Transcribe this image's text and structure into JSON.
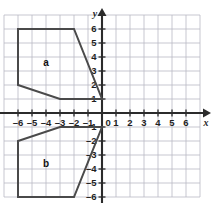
{
  "figure": {
    "background_color": "#ffffff",
    "grid_color": "#b9b9c4",
    "axis_color": "#2b2b2b",
    "shape_stroke_color": "#4a4a4a"
  },
  "axes": {
    "x_axis_name": "x",
    "y_axis_name": "y",
    "x_min": -7,
    "x_max": 7,
    "y_min": -6,
    "y_max": 7,
    "x_tick_labels": [
      "–6",
      "–5",
      "–4",
      "–3",
      "–2",
      "–1",
      "1",
      "2",
      "3",
      "4",
      "5",
      "6"
    ],
    "x_tick_values": [
      -6,
      -5,
      -4,
      -3,
      -2,
      -1,
      1,
      2,
      3,
      4,
      5,
      6
    ],
    "y_tick_labels": [
      "6",
      "5",
      "4",
      "3",
      "2",
      "1",
      "–1",
      "–2",
      "–3",
      "–4",
      "–5",
      "–6"
    ],
    "y_tick_values": [
      6,
      5,
      4,
      3,
      2,
      1,
      -1,
      -2,
      -3,
      -4,
      -5,
      -6
    ],
    "origin_label": "0"
  },
  "shapes": [
    {
      "name": "a",
      "label": "a",
      "label_x": -4,
      "label_y": 3.6,
      "vertices": [
        [
          -6,
          6
        ],
        [
          -2,
          6
        ],
        [
          0,
          1
        ],
        [
          -3,
          1
        ],
        [
          -6,
          2
        ]
      ]
    },
    {
      "name": "b",
      "label": "b",
      "label_x": -4,
      "label_y": -3.6,
      "vertices": [
        [
          -6,
          -6
        ],
        [
          -2,
          -6
        ],
        [
          0,
          -1
        ],
        [
          -3,
          -1
        ],
        [
          -6,
          -2
        ]
      ]
    }
  ]
}
